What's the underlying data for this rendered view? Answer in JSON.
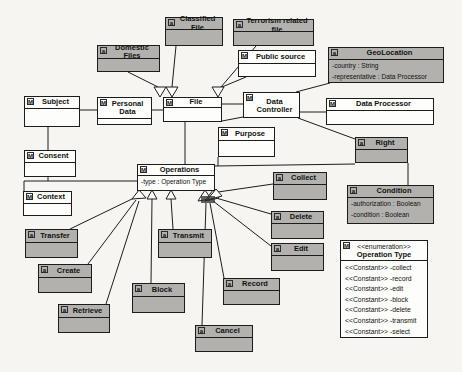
{
  "diagram": {
    "colors": {
      "highlight_fill": "#b3b1ae",
      "plain_fill": "#fdfdfc",
      "line": "#1c1c1c",
      "background": "#f6f5f2"
    },
    "classes": [
      {
        "id": "subject",
        "icon": "M",
        "name": "Subject",
        "highlight": false,
        "attributes": []
      },
      {
        "id": "personal-data",
        "icon": "M",
        "name": "Personal Data",
        "highlight": false,
        "attributes": []
      },
      {
        "id": "file",
        "icon": "M",
        "name": "File",
        "highlight": false,
        "attributes": []
      },
      {
        "id": "domestic-files",
        "icon": "a",
        "name": "Domestic Files",
        "highlight": true,
        "attributes": []
      },
      {
        "id": "classified-file",
        "icon": "a",
        "name": "Classified File",
        "highlight": true,
        "attributes": []
      },
      {
        "id": "terrorism-related-file",
        "icon": "a",
        "name": "Terrorism related file",
        "highlight": true,
        "attributes": []
      },
      {
        "id": "public-source",
        "icon": "M",
        "name": "Public source",
        "highlight": false,
        "attributes": []
      },
      {
        "id": "geolocation",
        "icon": "a",
        "name": "GeoLocation",
        "highlight": true,
        "attributes": [
          "-country : String",
          "-representative : Data Processor"
        ]
      },
      {
        "id": "data-controller",
        "icon": "M",
        "name": "Data Controller",
        "highlight": false,
        "attributes": []
      },
      {
        "id": "data-processor",
        "icon": "M",
        "name": "Data Processor",
        "highlight": false,
        "attributes": []
      },
      {
        "id": "purpose",
        "icon": "M",
        "name": "Purpose",
        "highlight": false,
        "attributes": []
      },
      {
        "id": "consent",
        "icon": "M",
        "name": "Consent",
        "highlight": false,
        "attributes": []
      },
      {
        "id": "context",
        "icon": "M",
        "name": "Context",
        "highlight": false,
        "attributes": []
      },
      {
        "id": "operations",
        "icon": "M",
        "name": "Operations",
        "highlight": false,
        "attributes": [
          "-type : Operation Type"
        ]
      },
      {
        "id": "right",
        "icon": "a",
        "name": "Right",
        "highlight": true,
        "attributes": []
      },
      {
        "id": "condition",
        "icon": "a",
        "name": "Condition",
        "highlight": true,
        "attributes": [
          "-authorization : Boolean",
          "-condition : Boolean"
        ]
      },
      {
        "id": "collect",
        "icon": "a",
        "name": "Collect",
        "highlight": true,
        "attributes": []
      },
      {
        "id": "delete",
        "icon": "a",
        "name": "Delete",
        "highlight": true,
        "attributes": []
      },
      {
        "id": "edit",
        "icon": "a",
        "name": "Edit",
        "highlight": true,
        "attributes": []
      },
      {
        "id": "transfer",
        "icon": "a",
        "name": "Transfer",
        "highlight": true,
        "attributes": []
      },
      {
        "id": "create",
        "icon": "a",
        "name": "Create",
        "highlight": true,
        "attributes": []
      },
      {
        "id": "retrieve",
        "icon": "a",
        "name": "Retrieve",
        "highlight": true,
        "attributes": []
      },
      {
        "id": "block",
        "icon": "a",
        "name": "Block",
        "highlight": true,
        "attributes": []
      },
      {
        "id": "transmit",
        "icon": "a",
        "name": "Transmit",
        "highlight": true,
        "attributes": []
      },
      {
        "id": "record",
        "icon": "a",
        "name": "Record",
        "highlight": true,
        "attributes": []
      },
      {
        "id": "cancel",
        "icon": "a",
        "name": "Cancel",
        "highlight": true,
        "attributes": []
      }
    ],
    "enumeration": {
      "id": "operation-type",
      "icon": "M",
      "stereotype": "<<enumeration>>",
      "name": "Operation Type",
      "literals": [
        "<<Constant>> -collect",
        "<<Constant>> -record",
        "<<Constant>> -edit",
        "<<Constant>> -block",
        "<<Constant>> -delete",
        "<<Constant>> -transmit",
        "<<Constant>> -select"
      ]
    }
  }
}
